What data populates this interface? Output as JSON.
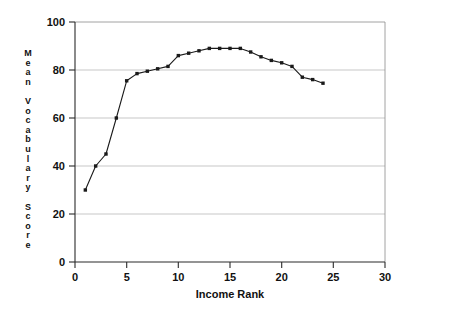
{
  "chart_data": {
    "type": "line",
    "title": "",
    "subtitle": "",
    "xlabel": "Income Rank",
    "ylabel": "Mean Vocabulary Score",
    "ylabel_stacked": "M e a n   V o c a b u l a r y   S c o r e",
    "xlim": [
      0,
      30
    ],
    "ylim": [
      0,
      100
    ],
    "xticks": [
      0,
      5,
      10,
      15,
      20,
      25,
      30
    ],
    "xtick_labels": [
      "0",
      "5",
      "10",
      "15",
      "20",
      "25",
      "30"
    ],
    "yticks": [
      0,
      20,
      40,
      60,
      80,
      100
    ],
    "ytick_labels": [
      "0",
      "20",
      "40",
      "60",
      "80",
      "100"
    ],
    "grid": "horizontal",
    "legend": "none",
    "marker": "square",
    "line_color": "#1a1a1a",
    "grid_color": "#b9b9b9",
    "axis_color": "#2b2b2b",
    "background": "#ffffff",
    "x": [
      1,
      2,
      3,
      4,
      5,
      6,
      7,
      8,
      9,
      10,
      11,
      12,
      13,
      14,
      15,
      16,
      17,
      18,
      19,
      20,
      21,
      22,
      23,
      24
    ],
    "values": [
      30,
      40,
      45,
      60,
      75.5,
      78.5,
      79.5,
      80.5,
      81.5,
      86,
      87,
      88,
      89,
      89,
      89,
      89,
      87.5,
      85.5,
      84,
      83,
      81.5,
      77,
      76,
      74.5
    ],
    "series": [
      {
        "name": "Mean Vocabulary Score",
        "values": [
          30,
          40,
          45,
          60,
          75.5,
          78.5,
          79.5,
          80.5,
          81.5,
          86,
          87,
          88,
          89,
          89,
          89,
          89,
          87.5,
          85.5,
          84,
          83,
          81.5,
          77,
          76,
          74.5
        ]
      }
    ],
    "annotations": []
  },
  "ylabel_letters": [
    "M",
    "e",
    "a",
    "n",
    "",
    "V",
    "o",
    "c",
    "a",
    "b",
    "u",
    "l",
    "a",
    "r",
    "y",
    "",
    "S",
    "c",
    "o",
    "r",
    "e"
  ]
}
